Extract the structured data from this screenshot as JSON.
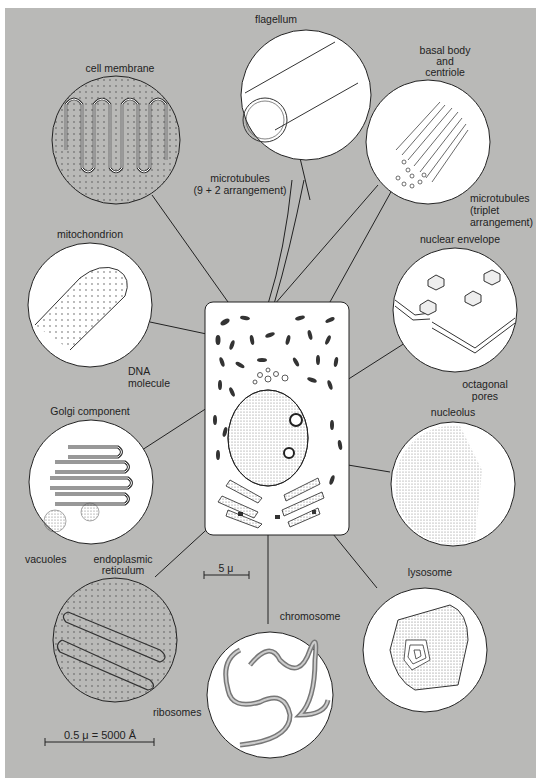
{
  "diagram": {
    "background_color": "#b9b9b7",
    "cell": {
      "scale_bar": "5 μ"
    },
    "scale_bar_magnified": "0.5 μ = 5000 Å",
    "organelles": [
      {
        "id": "flagellum",
        "label": "flagellum",
        "annotations": [
          "microtubules",
          "(9 + 2 arrangement)"
        ]
      },
      {
        "id": "cell-membrane",
        "label": "cell membrane"
      },
      {
        "id": "basal-body",
        "label_lines": [
          "basal body",
          "and",
          "centriole"
        ],
        "annotations": [
          "microtubules",
          "(triplet",
          "arrangement)"
        ]
      },
      {
        "id": "mitochondrion",
        "label": "mitochondrion",
        "annotations": [
          "DNA",
          "molecule"
        ]
      },
      {
        "id": "nuclear-envelope",
        "label": "nuclear envelope",
        "annotations": [
          "octagonal",
          "pores"
        ]
      },
      {
        "id": "golgi",
        "label": "Golgi component",
        "annotations": [
          "vacuoles"
        ]
      },
      {
        "id": "nucleolus",
        "label": "nucleolus"
      },
      {
        "id": "er",
        "label_lines": [
          "endoplasmic",
          "reticulum"
        ],
        "annotations": [
          "ribosomes"
        ]
      },
      {
        "id": "chromosome",
        "label": "chromosome"
      },
      {
        "id": "lysosome",
        "label": "lysosome"
      }
    ]
  }
}
